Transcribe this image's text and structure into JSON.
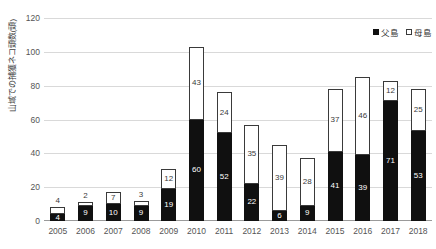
{
  "chart_data": {
    "type": "bar",
    "subtype": "stacked-column",
    "title": "",
    "xlabel": "",
    "ylabel": "山域での捕獲ネコ頭数(頭)",
    "ylim": [
      0,
      120
    ],
    "ytick_step": 20,
    "yticks": [
      "0",
      "20",
      "40",
      "60",
      "80",
      "100",
      "120"
    ],
    "grid": true,
    "legend_position": "top-right",
    "categories": [
      "2005",
      "2006",
      "2007",
      "2008",
      "2009",
      "2010",
      "2011",
      "2012",
      "2013",
      "2014",
      "2015",
      "2016",
      "2017",
      "2018"
    ],
    "series": [
      {
        "name": "父島",
        "color": "#101010",
        "values": [
          4,
          9,
          10,
          9,
          19,
          60,
          52,
          22,
          6,
          9,
          41,
          39,
          71,
          53
        ]
      },
      {
        "name": "母島",
        "color": "#ffffff",
        "values": [
          4,
          2,
          7,
          3,
          12,
          43,
          24,
          35,
          39,
          28,
          37,
          46,
          12,
          25
        ]
      }
    ],
    "totals": [
      8,
      11,
      17,
      12,
      31,
      103,
      76,
      57,
      45,
      37,
      78,
      85,
      83,
      78
    ]
  },
  "legend": {
    "items": [
      {
        "label": "父島",
        "swatch": "black-square-icon"
      },
      {
        "label": "母島",
        "swatch": "white-square-icon"
      }
    ]
  }
}
